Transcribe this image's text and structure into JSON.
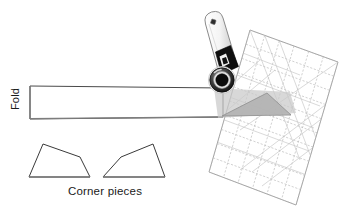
{
  "figure": {
    "background_color": "#ffffff",
    "width": 346,
    "height": 216
  },
  "labels": {
    "fold": "Fold",
    "corner_pieces": "Corner pieces"
  },
  "colors": {
    "outline": "#3a3a3a",
    "fold_edge": "#6e6e6e",
    "ruler_grid": "#b9b9b9",
    "ruler_edge": "#a9a9a9",
    "shade_light": "#d2d2d2",
    "shade_mid": "#bdbdbd",
    "cutter_body": "#f2f2f2",
    "cutter_outline": "#8a8a8a",
    "blade_dark": "#0d0d0d",
    "blade_ring": "#5a5a5a",
    "text": "#1a1a1a"
  },
  "objects": {
    "fabric_strip": {
      "name": "fabric-strip",
      "description": "Long horizontal folded fabric strip",
      "points": "30,86 223,88 223,117 30,119",
      "fold_edge_points": "30,86 30,119"
    },
    "rotary_cutter": {
      "name": "rotary-cutter",
      "description": "Rotary cutter tool angled over the strip end",
      "handle_points": "204,21 221,12 236,67 218,76",
      "handle_hole": {
        "cx": 213,
        "cy": 22,
        "r": 2.3
      },
      "grip_points": "214,53 231,46 238,67 221,74",
      "blade": {
        "cx": 222,
        "cy": 80,
        "r_outer": 13.5,
        "r_mid": 10,
        "r_inner": 6.5
      }
    },
    "ruler": {
      "name": "quilting-ruler",
      "description": "Transparent gridded quilting ruler, rotated",
      "corners": "250,30 338,62 296,205 209,172",
      "grid_cols": 6,
      "grid_rows": 10,
      "has_diagonals": true
    },
    "shaded_cut_region": {
      "name": "shaded-cut-region",
      "points": "214,88 290,92 296,113 218,118"
    },
    "cut_triangle": {
      "name": "cut-triangle-marking",
      "points": "222,116 267,93 291,115"
    },
    "corner_piece_left": {
      "name": "corner-piece-left",
      "points": "29,177 43,144 80,157 90,177"
    },
    "corner_piece_right": {
      "name": "corner-piece-right",
      "points": "103,177 121,157 153,144 165,177"
    }
  }
}
